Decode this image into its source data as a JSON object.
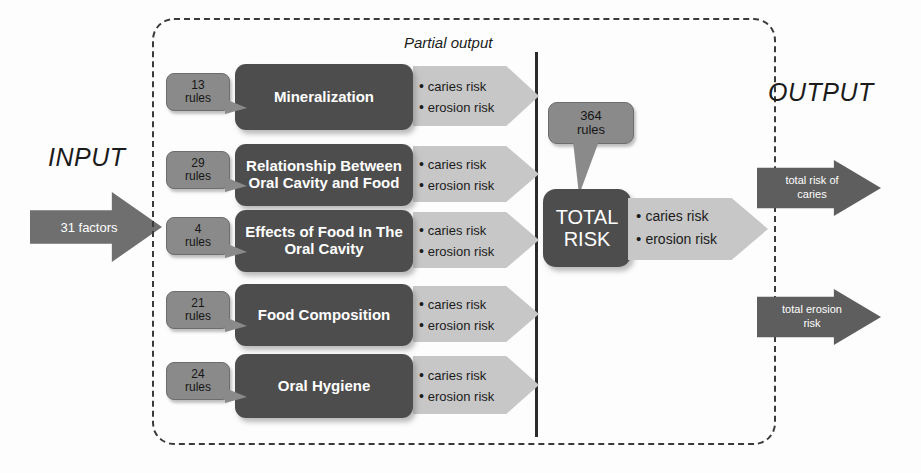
{
  "diagram": {
    "input_label": "INPUT",
    "output_label": "OUTPUT",
    "partial_output_label": "Partial output",
    "input_arrow_text": "31 factors",
    "modules": [
      {
        "name": "Mineralization",
        "rules_count": "13",
        "rules_unit": "rules",
        "outputs": [
          "caries risk",
          "erosion risk"
        ]
      },
      {
        "name": "Relationship Between Oral Cavity and Food",
        "rules_count": "29",
        "rules_unit": "rules",
        "outputs": [
          "caries risk",
          "erosion risk"
        ]
      },
      {
        "name": "Effects of Food In The Oral Cavity",
        "rules_count": "4",
        "rules_unit": "rules",
        "outputs": [
          "caries risk",
          "erosion risk"
        ]
      },
      {
        "name": "Food Composition",
        "rules_count": "21",
        "rules_unit": "rules",
        "outputs": [
          "caries risk",
          "erosion risk"
        ]
      },
      {
        "name": "Oral Hygiene",
        "rules_count": "24",
        "rules_unit": "rules",
        "outputs": [
          "caries risk",
          "erosion risk"
        ]
      }
    ],
    "total": {
      "rules_count": "364",
      "rules_unit": "rules",
      "title_line1": "TOTAL",
      "title_line2": "RISK",
      "outputs": [
        "caries risk",
        "erosion risk"
      ]
    },
    "outputs": [
      {
        "line1": "total risk of",
        "line2": "caries"
      },
      {
        "line1": "total erosion",
        "line2": "risk"
      }
    ],
    "colors": {
      "module_box": "#4d4d4d",
      "rules_callout": "#8a8a8a",
      "partial_arrow": "#c7c7c7",
      "input_arrow": "#6f6f6f",
      "output_arrow": "#5e5e5e",
      "border_dashed": "#3a3a3a"
    }
  }
}
